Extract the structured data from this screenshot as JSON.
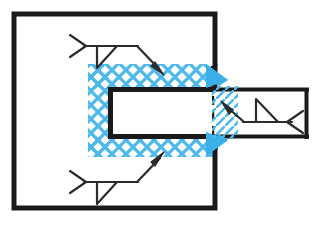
{
  "diagram": {
    "type": "engineering-weld-diagram",
    "canvas": {
      "width": 330,
      "height": 230,
      "background": "#ffffff"
    },
    "colors": {
      "line": "#1a1a1a",
      "weld_blue": "#4db8ec",
      "weld_blue_solid": "#3bb0e8",
      "fill_white": "#ffffff"
    },
    "shapes": {
      "outer_plate": {
        "name": "outer-plate-square",
        "x": 14,
        "y": 14,
        "width": 201,
        "height": 194,
        "stroke_width": 5,
        "fill": "#ffffff"
      },
      "right_member": {
        "name": "right-member-rectangle",
        "x": 212,
        "y": 88,
        "width": 96,
        "height": 50,
        "stroke_width": 4,
        "fill": "#ffffff",
        "left_edge_style": "dashed"
      },
      "inner_cavity": {
        "name": "inner-cavity-rectangle",
        "x": 108,
        "y": 88,
        "width": 104,
        "height": 50,
        "stroke_width": 5,
        "fill": "#ffffff"
      },
      "weld_hatch": {
        "name": "weld-cross-hatch-band",
        "pattern": "x-cross-hatch",
        "color": "#4db8ec",
        "bands": [
          {
            "name": "top-band",
            "x": 88,
            "y": 64,
            "width": 128,
            "height": 24
          },
          {
            "name": "left-band",
            "x": 88,
            "y": 64,
            "width": 20,
            "height": 92
          },
          {
            "name": "bottom-band",
            "x": 88,
            "y": 138,
            "width": 128,
            "height": 18
          }
        ]
      },
      "weld_wedges": [
        {
          "name": "upper-weld-wedge",
          "x": 206,
          "y": 64,
          "size": 22
        },
        {
          "name": "lower-weld-wedge",
          "x": 206,
          "y": 133,
          "size": 22
        }
      ],
      "weld_diagonal_hatch": [
        {
          "name": "upper-diagonal-hatch",
          "x": 212,
          "y": 86,
          "width": 26,
          "height": 26
        },
        {
          "name": "lower-diagonal-hatch",
          "x": 212,
          "y": 112,
          "width": 26,
          "height": 26
        }
      ]
    },
    "weld_symbols": [
      {
        "name": "weld-symbol-top-left",
        "tail": {
          "type": "fork",
          "apex_x": 84,
          "apex_y": 46
        },
        "reference_line": {
          "x1": 84,
          "y1": 46,
          "x2": 136,
          "y2": 46
        },
        "weld_glyph": {
          "type": "fillet-triangle",
          "side": "below",
          "x": 97,
          "y": 46,
          "width": 20,
          "height": 22
        },
        "leader": {
          "x1": 136,
          "y1": 46,
          "x2": 163,
          "y2": 73
        },
        "arrow": {
          "direction": "down-right",
          "tip_x": 163,
          "tip_y": 73
        }
      },
      {
        "name": "weld-symbol-bottom-left",
        "tail": {
          "type": "fork",
          "apex_x": 84,
          "apex_y": 182
        },
        "reference_line": {
          "x1": 84,
          "y1": 182,
          "x2": 136,
          "y2": 182
        },
        "weld_glyph": {
          "type": "fillet-triangle",
          "side": "below",
          "x": 97,
          "y": 182,
          "width": 20,
          "height": 22
        },
        "leader": {
          "x1": 136,
          "y1": 182,
          "x2": 163,
          "y2": 155
        },
        "arrow": {
          "direction": "up-right",
          "tip_x": 163,
          "tip_y": 155
        }
      },
      {
        "name": "weld-symbol-right",
        "tail": {
          "type": "fork",
          "apex_x": 288,
          "apex_y": 122
        },
        "reference_line": {
          "x1": 243,
          "y1": 122,
          "x2": 288,
          "y2": 122
        },
        "weld_glyph": {
          "type": "fillet-triangle",
          "side": "above",
          "x": 255,
          "y": 122,
          "width": 22,
          "height": 24
        },
        "leader": {
          "x1": 243,
          "y1": 122,
          "x2": 222,
          "y2": 103
        },
        "arrow": {
          "direction": "up-left",
          "tip_x": 222,
          "tip_y": 103
        }
      }
    ]
  }
}
